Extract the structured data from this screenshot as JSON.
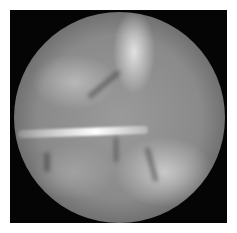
{
  "image": {
    "description": "Grayscale arthroscopic view inside a circular scope field on a black square frame",
    "frame_color": "#050505",
    "background_color": "#ffffff",
    "highlight_color": "#ffffff",
    "tissue_tone": "#9a9a9a"
  }
}
